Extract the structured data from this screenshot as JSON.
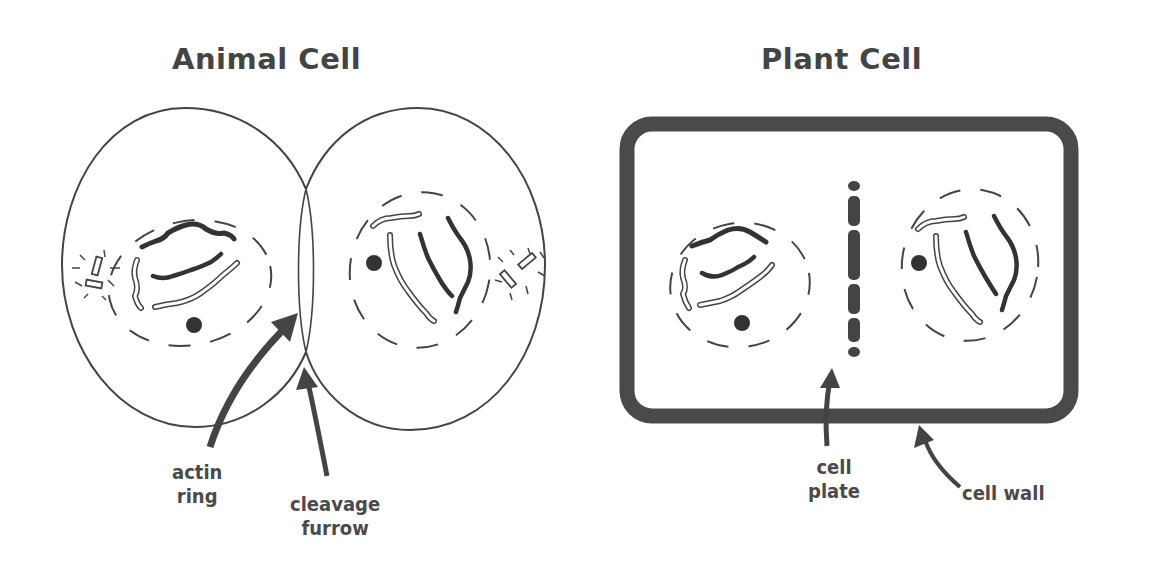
{
  "colors": {
    "ink": "#444444",
    "wall": "#4a4a4a",
    "background": "#ffffff"
  },
  "animal_cell": {
    "title": "Animal Cell",
    "labels": {
      "actin_ring": [
        "actin",
        "ring"
      ],
      "cleavage_furrow": [
        "cleavage",
        "furrow"
      ]
    }
  },
  "plant_cell": {
    "title": "Plant Cell",
    "labels": {
      "cell_plate": [
        "cell",
        "plate"
      ],
      "cell_wall": "cell wall"
    }
  }
}
